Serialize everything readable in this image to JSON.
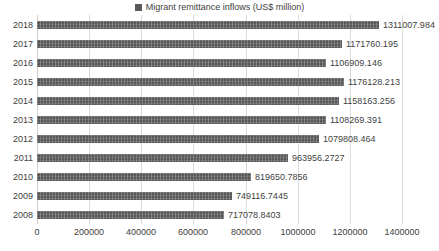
{
  "colors": {
    "bar": "#595959",
    "gridline": "#dcdcdc",
    "axis_line": "#d0d0d0",
    "text": "#404040"
  },
  "chart_data": {
    "type": "bar",
    "orientation": "horizontal",
    "title": "",
    "legend_label": "Migrant remittance inflows (US$ million)",
    "legend_position": "top",
    "categories": [
      "2018",
      "2017",
      "2016",
      "2015",
      "2014",
      "2013",
      "2012",
      "2011",
      "2010",
      "2009",
      "2008"
    ],
    "values": [
      1311007.984,
      1171760.195,
      1106909.146,
      1176128.213,
      1158163.256,
      1108269.391,
      1079808.464,
      963956.2727,
      819650.7856,
      749116.7445,
      717078.8403
    ],
    "value_labels": [
      "1311007.984",
      "1171760.195",
      "1106909.146",
      "1176128.213",
      "1158163.256",
      "1108269.391",
      "1079808.464",
      "963956.2727",
      "819650.7856",
      "749116.7445",
      "717078.8403"
    ],
    "xlabel": "",
    "ylabel": "",
    "xlim": [
      0,
      1400000
    ],
    "x_ticks": [
      "0",
      "200000",
      "400000",
      "600000",
      "800000",
      "1000000",
      "1200000",
      "1400000"
    ],
    "x_tick_values": [
      0,
      200000,
      400000,
      600000,
      800000,
      1000000,
      1200000,
      1400000
    ],
    "grid": true
  }
}
